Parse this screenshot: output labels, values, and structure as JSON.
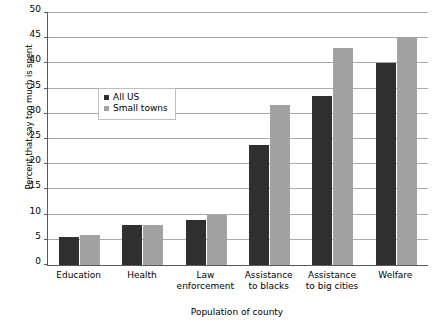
{
  "chart_data": {
    "type": "bar",
    "title": "",
    "xlabel": "Population of county",
    "ylabel": "Percent that say too much is spent",
    "ylim": [
      0,
      50
    ],
    "yticks": [
      0,
      5,
      10,
      15,
      20,
      25,
      30,
      35,
      40,
      45,
      50
    ],
    "ytick_labels": [
      "0",
      "5",
      "10",
      "15",
      "20",
      "25",
      "30",
      "35",
      "40",
      "45",
      "50"
    ],
    "grid": true,
    "legend_position": "upper left inside",
    "categories": [
      "Education",
      "Health",
      "Law\nenforcement",
      "Assistance\nto blacks",
      "Assistance\nto big cities",
      "Welfare"
    ],
    "series": [
      {
        "name": "All US",
        "color": "#2f2f2f",
        "values": [
          5.5,
          8.0,
          9.0,
          23.8,
          33.5,
          40.0
        ]
      },
      {
        "name": "Small towns",
        "color": "#a2a2a2",
        "values": [
          6.0,
          8.0,
          9.9,
          31.8,
          43.0,
          45.3
        ]
      }
    ]
  },
  "legend": {
    "items": [
      {
        "label": "All US"
      },
      {
        "label": "Small towns"
      }
    ]
  }
}
